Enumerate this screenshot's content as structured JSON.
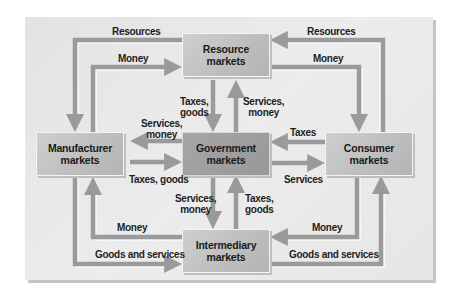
{
  "diagram": {
    "title": "",
    "nodes": {
      "resource": "Resource\nmarkets",
      "manufacturer": "Manufacturer\nmarkets",
      "government": "Government\nmarkets",
      "consumer": "Consumer\nmarkets",
      "intermediary": "Intermediary\nmarkets"
    },
    "flows": {
      "top_left_resources": "Resources",
      "top_left_money": "Money",
      "top_right_resources": "Resources",
      "top_right_money": "Money",
      "resource_to_gov": "Taxes,\ngoods",
      "gov_to_resource": "Services,\nmoney",
      "gov_to_manufacturer": "Services,\nmoney",
      "manufacturer_to_gov": "Taxes, goods",
      "consumer_to_gov": "Taxes",
      "gov_to_consumer": "Services",
      "gov_to_intermediary": "Services,\nmoney",
      "intermediary_to_gov": "Taxes,\ngoods",
      "bottom_left_money": "Money",
      "bottom_left_goods": "Goods and services",
      "bottom_right_money": "Money",
      "bottom_right_goods": "Goods and services"
    },
    "edges": [
      {
        "from": "Consumer markets",
        "to": "Resource markets",
        "label": "Resources"
      },
      {
        "from": "Resource markets",
        "to": "Manufacturer markets",
        "label": "Resources"
      },
      {
        "from": "Manufacturer markets",
        "to": "Resource markets",
        "label": "Money"
      },
      {
        "from": "Resource markets",
        "to": "Consumer markets",
        "label": "Money"
      },
      {
        "from": "Resource markets",
        "to": "Government markets",
        "label": "Taxes, goods"
      },
      {
        "from": "Government markets",
        "to": "Resource markets",
        "label": "Services, money"
      },
      {
        "from": "Government markets",
        "to": "Manufacturer markets",
        "label": "Services, money"
      },
      {
        "from": "Manufacturer markets",
        "to": "Government markets",
        "label": "Taxes, goods"
      },
      {
        "from": "Consumer markets",
        "to": "Government markets",
        "label": "Taxes"
      },
      {
        "from": "Government markets",
        "to": "Consumer markets",
        "label": "Services"
      },
      {
        "from": "Government markets",
        "to": "Intermediary markets",
        "label": "Services, money"
      },
      {
        "from": "Intermediary markets",
        "to": "Government markets",
        "label": "Taxes, goods"
      },
      {
        "from": "Intermediary markets",
        "to": "Manufacturer markets",
        "label": "Money"
      },
      {
        "from": "Manufacturer markets",
        "to": "Intermediary markets",
        "label": "Goods and services"
      },
      {
        "from": "Consumer markets",
        "to": "Intermediary markets",
        "label": "Money"
      },
      {
        "from": "Intermediary markets",
        "to": "Consumer markets",
        "label": "Goods and services"
      }
    ],
    "colors": {
      "panel": "#e8e8e8",
      "box": "#c4c4c4",
      "government_box": "#9c9c9c",
      "arrow": "#9a9a9a",
      "arrow_highlight": "#f2f2f2",
      "text": "#1a1a1a"
    }
  }
}
